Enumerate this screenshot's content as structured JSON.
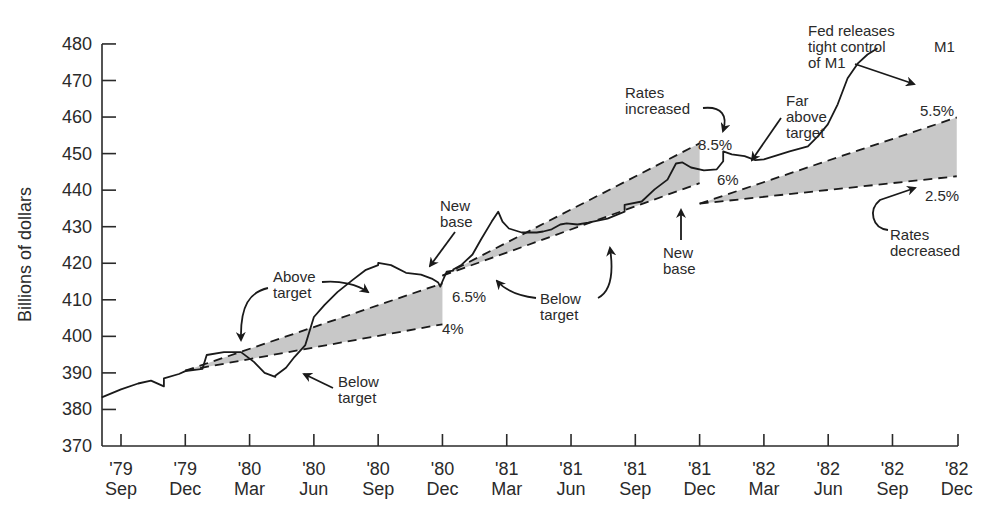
{
  "chart_data": {
    "type": "line",
    "title": "",
    "xlabel": "",
    "ylabel": "Billions of dollars",
    "ylim": [
      370,
      480
    ],
    "yticks": [
      370,
      380,
      390,
      400,
      410,
      420,
      430,
      440,
      450,
      460,
      470,
      480
    ],
    "grid": false,
    "legend": "none",
    "x_ticks": [
      {
        "year": "'79",
        "month": "Sep"
      },
      {
        "year": "'79",
        "month": "Dec"
      },
      {
        "year": "'80",
        "month": "Mar"
      },
      {
        "year": "'80",
        "month": "Jun"
      },
      {
        "year": "'80",
        "month": "Sep"
      },
      {
        "year": "'80",
        "month": "Dec"
      },
      {
        "year": "'81",
        "month": "Mar"
      },
      {
        "year": "'81",
        "month": "Jun"
      },
      {
        "year": "'81",
        "month": "Sep"
      },
      {
        "year": "'81",
        "month": "Dec"
      },
      {
        "year": "'82",
        "month": "Mar"
      },
      {
        "year": "'82",
        "month": "Jun"
      },
      {
        "year": "'82",
        "month": "Sep"
      },
      {
        "year": "'82",
        "month": "Dec"
      }
    ],
    "series": [
      {
        "name": "M1",
        "x_months_from_sep79": [
          -0.9,
          0.0,
          0.8,
          1.4,
          2.0,
          2.7,
          3.0,
          3.8,
          4.0,
          4.8,
          5.6,
          6.2,
          6.7,
          7.2,
          7.7,
          8.1,
          8.6,
          9.0,
          9.5,
          10.1,
          10.8,
          11.4,
          12.0,
          12.6,
          13.3,
          14.0,
          14.5,
          14.8,
          14.9,
          15.0,
          15.2,
          15.5,
          15.9,
          16.4,
          16.8,
          17.3,
          17.6,
          17.8,
          18.1,
          18.7,
          19.4,
          19.7,
          20.1,
          20.5,
          20.8,
          21.3,
          21.8,
          22.7,
          23.5,
          24.3,
          24.9,
          25.5,
          25.9,
          26.2,
          26.6,
          27.2,
          27.8,
          28.1,
          28.5,
          29.1,
          29.6,
          30.0,
          30.6,
          31.2,
          31.7,
          32.3,
          33.0,
          33.8,
          34.3,
          34.6,
          35.3
        ],
        "values": [
          383.3,
          385.5,
          387.1,
          387.9,
          386.3,
          388.5,
          389.7,
          390.5,
          391.1,
          394.9,
          395.7,
          395.7,
          393.0,
          390.0,
          388.9,
          389.2,
          391.4,
          394.4,
          397.6,
          405.3,
          408.6,
          412.1,
          415.4,
          418.1,
          419.5,
          420.1,
          419.5,
          417.4,
          416.9,
          415.8,
          414.7,
          413.6,
          415.0,
          417.7,
          418.0,
          418.3,
          419.6,
          422.4,
          426.5,
          431.4,
          434.1,
          431.4,
          429.5,
          428.4,
          428.4,
          428.4,
          428.7,
          429.3,
          430.6,
          430.9,
          430.6,
          431.1,
          432.2,
          434.1,
          436.0,
          436.9,
          440.2,
          442.9,
          447.3,
          447.6,
          446.2,
          445.4,
          445.7,
          447.9,
          450.6,
          449.8,
          449.3,
          448.2,
          448.4,
          449.5,
          450.6,
          452.0,
          454.7,
          458.0,
          463.5,
          470.6,
          474.6,
          477.1,
          478.8
        ]
      }
    ],
    "target_cones": [
      {
        "start": "'79 Dec",
        "end": "'80 Dec",
        "base": 390.6,
        "upper_end": 414.5,
        "lower_end": 403.3,
        "upper_label": "6.5%",
        "lower_label": "4%"
      },
      {
        "start": "'80 Dec",
        "end": "'81 Dec",
        "base": 416.6,
        "upper_end": 452.8,
        "lower_end": 441.9,
        "upper_label": "8.5%",
        "lower_label": "6%"
      },
      {
        "start": "'81 Dec",
        "end": "'82 Dec",
        "base": 436.3,
        "upper_end": 459.9,
        "lower_end": 443.8,
        "upper_label": "5.5%",
        "lower_label": "2.5%"
      }
    ],
    "annotations": [
      "Above target",
      "Below target",
      "New base",
      "Above target",
      "6.5%",
      "4%",
      "Below target",
      "Rates increased",
      "8.5%",
      "New base",
      "6%",
      "Far above target",
      "Fed releases tight control of M1",
      "M1",
      "5.5%",
      "2.5%",
      "Rates decreased"
    ]
  },
  "labels": {
    "ylabel": "Billions of dollars",
    "ann_above_target_1_l1": "Above",
    "ann_above_target_1_l2": "target",
    "ann_below_target_1_l1": "Below",
    "ann_below_target_1_l2": "target",
    "ann_new_base_1_l1": "New",
    "ann_new_base_1_l2": "base",
    "ann_pct_65": "6.5%",
    "ann_pct_4": "4%",
    "ann_below_target_2_l1": "Below",
    "ann_below_target_2_l2": "target",
    "ann_rates_inc_l1": "Rates",
    "ann_rates_inc_l2": "increased",
    "ann_pct_85": "8.5%",
    "ann_new_base_2_l1": "New",
    "ann_new_base_2_l2": "base",
    "ann_pct_6": "6%",
    "ann_far_above_l1": "Far",
    "ann_far_above_l2": "above",
    "ann_far_above_l3": "target",
    "ann_fed_l1": "Fed releases",
    "ann_fed_l2": "tight control",
    "ann_fed_l3": "of M1",
    "ann_m1": "M1",
    "ann_pct_55": "5.5%",
    "ann_pct_25": "2.5%",
    "ann_rates_dec_l1": "Rates",
    "ann_rates_dec_l2": "decreased"
  },
  "colors": {
    "line": "#1a1a1a",
    "cone_fill": "#c8c8c8",
    "axis": "#2a2a2a"
  }
}
